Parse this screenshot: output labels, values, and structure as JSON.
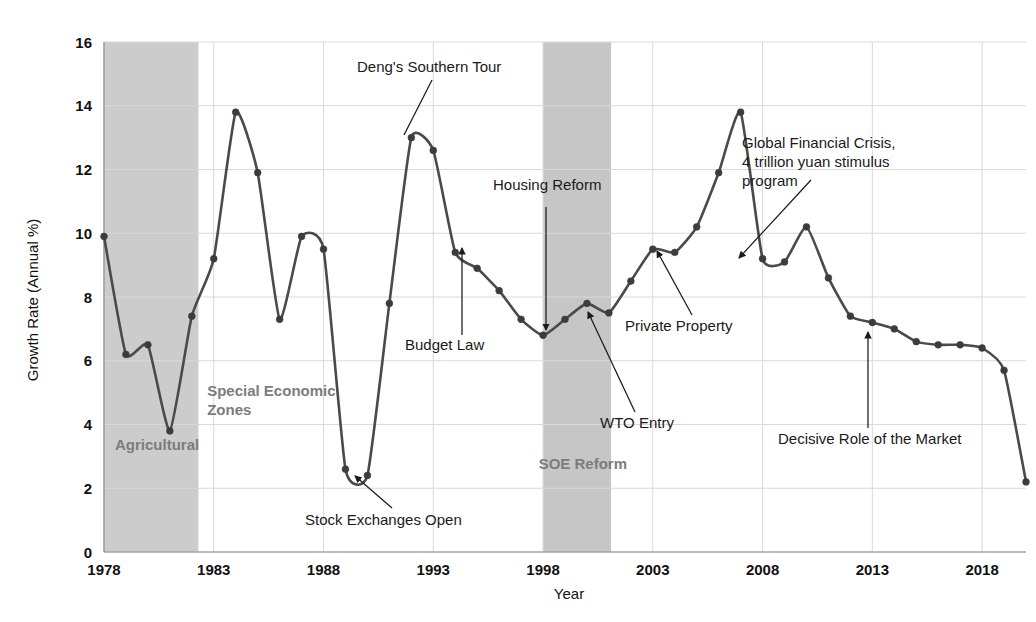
{
  "chart_data": {
    "type": "line",
    "title": "",
    "xlabel": "Year",
    "ylabel": "Growth Rate (Annual %)",
    "xlim": [
      1978,
      2020
    ],
    "ylim": [
      0,
      16
    ],
    "xticks": [
      "1978",
      "1983",
      "1988",
      "1993",
      "1998",
      "2003",
      "2008",
      "2013",
      "2018"
    ],
    "xtick_values": [
      1978,
      1983,
      1988,
      1993,
      1998,
      2003,
      2008,
      2013,
      2018
    ],
    "yticks": [
      "0",
      "2",
      "4",
      "6",
      "8",
      "10",
      "12",
      "14",
      "16"
    ],
    "ytick_values": [
      0,
      2,
      4,
      6,
      8,
      10,
      12,
      14,
      16
    ],
    "grid": true,
    "legend": "none",
    "series": [
      {
        "name": "Growth Rate (Annual %)",
        "color": "#4a4a4a",
        "marker": "circle",
        "x": [
          1978,
          1979,
          1980,
          1981,
          1982,
          1983,
          1984,
          1985,
          1986,
          1987,
          1988,
          1989,
          1990,
          1991,
          1992,
          1993,
          1994,
          1995,
          1996,
          1997,
          1998,
          1999,
          2000,
          2001,
          2002,
          2003,
          2004,
          2005,
          2006,
          2007,
          2008,
          2009,
          2010,
          2011,
          2012,
          2013,
          2014,
          2015,
          2016,
          2017,
          2018,
          2019,
          2020
        ],
        "values": [
          9.9,
          6.2,
          6.5,
          3.8,
          7.4,
          9.2,
          13.8,
          11.9,
          7.3,
          9.9,
          9.5,
          2.6,
          2.4,
          7.8,
          13.0,
          12.6,
          9.4,
          8.9,
          8.2,
          7.3,
          6.8,
          7.3,
          7.8,
          7.5,
          8.5,
          9.5,
          9.4,
          10.2,
          11.9,
          13.8,
          9.2,
          9.1,
          10.2,
          8.6,
          7.4,
          7.2,
          7.0,
          6.6,
          6.5,
          6.5,
          6.4,
          5.7,
          2.2
        ]
      }
    ],
    "shaded_bands": [
      {
        "name": "Agricultural",
        "label": "Agricultural",
        "x_start": 1978,
        "x_end": 1982.3,
        "color": "#cccccc",
        "label_x": 1978.5,
        "label_y": 3.2
      },
      {
        "name": "Special Economic Zones",
        "label_line1": "Special Economic",
        "label_line2": "Zones",
        "label_x": 1982.7,
        "label_y": 4.9
      },
      {
        "name": "SOE Reform",
        "label": "SOE Reform",
        "x_start": 1998,
        "x_end": 2001.1,
        "color": "#c6c6c6",
        "label_x": 1997.8,
        "label_y": 2.6
      }
    ],
    "annotations": [
      {
        "name": "dengs-southern-tour",
        "text": "Deng's Southern Tour",
        "text_x": 357,
        "text_y": 72,
        "arrow_from_x": 432,
        "arrow_from_y": 80,
        "arrow_to_x": 404,
        "arrow_to_y": 135,
        "arrow_head": false,
        "anchor": "start"
      },
      {
        "name": "budget-law",
        "text": "Budget Law",
        "text_x": 405,
        "text_y": 350,
        "arrow_from_x": 462,
        "arrow_from_y": 335,
        "arrow_to_x": 462,
        "arrow_to_y": 248,
        "arrow_head": true,
        "anchor": "start"
      },
      {
        "name": "housing-reform",
        "text": "Housing Reform",
        "text_x": 493,
        "text_y": 190,
        "arrow_from_x": 546,
        "arrow_from_y": 207,
        "arrow_to_x": 546,
        "arrow_to_y": 330,
        "arrow_head": true,
        "anchor": "start"
      },
      {
        "name": "wto-entry",
        "text": "WTO Entry",
        "text_x": 600,
        "text_y": 428,
        "arrow_from_x": 635,
        "arrow_from_y": 412,
        "arrow_to_x": 588,
        "arrow_to_y": 312,
        "arrow_head": true,
        "anchor": "start"
      },
      {
        "name": "private-property",
        "text": "Private Property",
        "text_x": 625,
        "text_y": 331,
        "arrow_from_x": 692,
        "arrow_from_y": 315,
        "arrow_to_x": 657,
        "arrow_to_y": 251,
        "arrow_head": true,
        "anchor": "start"
      },
      {
        "name": "global-financial-crisis",
        "text_line1": "Global Financial Crisis,",
        "text_line2": "4 trillion yuan stimulus",
        "text_line3": "program",
        "text_x": 742,
        "text_y": 148,
        "arrow_from_x": 811,
        "arrow_from_y": 180,
        "arrow_to_x": 739,
        "arrow_to_y": 258,
        "arrow_head": true,
        "anchor": "start"
      },
      {
        "name": "stock-exchanges-open",
        "text": "Stock Exchanges Open",
        "text_x": 305,
        "text_y": 525,
        "arrow_from_x": 392,
        "arrow_from_y": 508,
        "arrow_to_x": 355,
        "arrow_to_y": 476,
        "arrow_head": true,
        "anchor": "start"
      },
      {
        "name": "decisive-role-of-the-market",
        "text": "Decisive Role of the Market",
        "text_x": 778,
        "text_y": 444,
        "arrow_from_x": 868,
        "arrow_from_y": 428,
        "arrow_to_x": 868,
        "arrow_to_y": 332,
        "arrow_head": true,
        "anchor": "start"
      }
    ],
    "colors": {
      "line": "#4a4a4a",
      "marker": "#3c3c3c",
      "grid": "#d9d9d9",
      "band": "#cccccc",
      "band_label": "#7c7c7c",
      "text": "#1a1a1a",
      "background": "#ffffff"
    }
  }
}
